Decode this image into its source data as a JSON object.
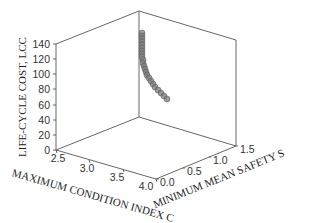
{
  "chart_data": {
    "type": "scatter3d",
    "title": "",
    "xlabel": "MAXIMUM CONDITION INDEX C",
    "ylabel": "MINIMUM MEAN SAFETY S",
    "zlabel": "LIFE-CYCLE COST, LCC",
    "x_ticks": [
      "2.5",
      "3.0",
      "3.5",
      "4.0"
    ],
    "y_ticks": [
      "0.0",
      "0.5",
      "1.0",
      "1.5"
    ],
    "z_ticks": [
      "0",
      "20",
      "40",
      "60",
      "80",
      "100",
      "120",
      "140"
    ],
    "xlim": [
      2.5,
      4.0
    ],
    "ylim": [
      0.0,
      1.5
    ],
    "zlim": [
      0,
      140
    ],
    "grid": false,
    "legend": null,
    "marker_color": "#7a7a7a",
    "series": [
      {
        "name": "Pareto solutions",
        "points_screen": [
          [
            142,
            33
          ],
          [
            142,
            36
          ],
          [
            142,
            39
          ],
          [
            142,
            42
          ],
          [
            142,
            45
          ],
          [
            142,
            48
          ],
          [
            142,
            51
          ],
          [
            142,
            54
          ],
          [
            142,
            57
          ],
          [
            143,
            60
          ],
          [
            143,
            63
          ],
          [
            144,
            66
          ],
          [
            145,
            69
          ],
          [
            146,
            72
          ],
          [
            147,
            75
          ],
          [
            149,
            78
          ],
          [
            151,
            81
          ],
          [
            153,
            84
          ],
          [
            155,
            87
          ],
          [
            158,
            90
          ],
          [
            161,
            93
          ],
          [
            164,
            96
          ],
          [
            167,
            99
          ]
        ]
      }
    ]
  }
}
